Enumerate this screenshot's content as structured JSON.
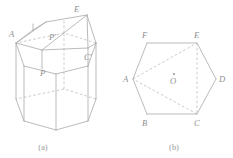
{
  "document": {
    "title": "Hexagonal prism cut section and hexagonal base diagram",
    "background_color": "#ffffff",
    "line_color": "#a9a9a9",
    "dashed_color": "#b5b5b5",
    "label_color": "#8f8f8f"
  },
  "figures": [
    {
      "id": "figure-a",
      "caption": "(a)",
      "description": "Hexagonal prism with an oblique cut plane through the top",
      "labels": [
        {
          "name": "A",
          "text": "A",
          "x": 10,
          "y": 34
        },
        {
          "name": "E-prime",
          "text": "E",
          "x": 75,
          "y": 10
        },
        {
          "name": "P-prime",
          "text": "P′",
          "x": 49,
          "y": 37
        },
        {
          "name": "C-prime",
          "text": "C′",
          "x": 84,
          "y": 57
        },
        {
          "name": "P",
          "text": "P",
          "x": 40,
          "y": 73
        }
      ]
    },
    {
      "id": "figure-b",
      "caption": "(b)",
      "description": "Regular hexagon ABCDEF with center O and inscribed triangle ACE",
      "center_point": {
        "name": "O",
        "text": "O",
        "x": 174,
        "y": 79
      },
      "labels": [
        {
          "name": "F",
          "text": "F",
          "x": 143,
          "y": 38
        },
        {
          "name": "E",
          "text": "E",
          "x": 196,
          "y": 38
        },
        {
          "name": "A",
          "text": "A",
          "x": 125,
          "y": 74
        },
        {
          "name": "D",
          "text": "D",
          "x": 212,
          "y": 74
        },
        {
          "name": "B",
          "text": "B",
          "x": 143,
          "y": 117
        },
        {
          "name": "C",
          "text": "C",
          "x": 196,
          "y": 117
        }
      ]
    }
  ],
  "captions": {
    "figure_a": "(a)",
    "figure_b": "(b)"
  }
}
